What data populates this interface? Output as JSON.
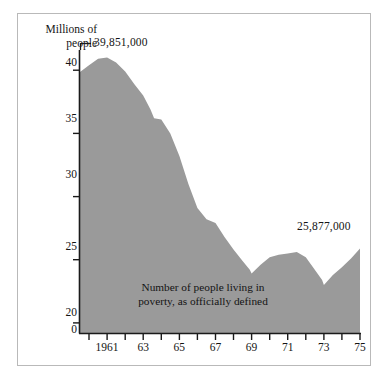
{
  "chart_data": {
    "type": "area",
    "title": "",
    "subtitle": "",
    "ylabel_line1": "Millions of",
    "ylabel_line2": "people",
    "xlabel": "",
    "annotation_caption_line1": "Number of people living in",
    "annotation_caption_line2": "poverty, as officially defined",
    "peak_annotation": "39,851,000",
    "end_annotation": "25,877,000",
    "fill_color": "#9a9a9a",
    "axis_color": "#1a1a1a",
    "grid": false,
    "legend": "none",
    "ylim": [
      19.2,
      41.6
    ],
    "yticks": [
      20,
      25,
      30,
      35,
      40
    ],
    "ytick_labels": [
      "20",
      "25",
      "30",
      "35",
      "40"
    ],
    "axis_break_label": "0",
    "xlim": [
      1959.5,
      1975
    ],
    "xticks": [
      1960,
      1961,
      1962,
      1963,
      1964,
      1965,
      1966,
      1967,
      1968,
      1969,
      1970,
      1971,
      1972,
      1973,
      1974,
      1975
    ],
    "xtick_labels": [
      {
        "year": 1961,
        "label": "1961"
      },
      {
        "year": 1963,
        "label": "63"
      },
      {
        "year": 1965,
        "label": "65"
      },
      {
        "year": 1967,
        "label": "67"
      },
      {
        "year": 1969,
        "label": "69"
      },
      {
        "year": 1971,
        "label": "71"
      },
      {
        "year": 1973,
        "label": "73"
      },
      {
        "year": 1975,
        "label": "75"
      }
    ],
    "x": [
      1959.5,
      1960,
      1960.5,
      1961,
      1961.5,
      1962,
      1962.5,
      1963,
      1963.4,
      1963.6,
      1964,
      1964.5,
      1965,
      1965.5,
      1966,
      1966.5,
      1967,
      1967.5,
      1968,
      1968.5,
      1968.9,
      1969,
      1969.5,
      1970,
      1970.5,
      1971,
      1971.5,
      1972,
      1972.5,
      1972.9,
      1973,
      1973.5,
      1974,
      1974.5,
      1975
    ],
    "values": [
      39.851,
      40.4,
      40.9,
      41.0,
      40.6,
      39.9,
      38.9,
      38.0,
      36.9,
      36.2,
      36.1,
      35.0,
      33.2,
      31.0,
      29.1,
      28.2,
      27.9,
      26.8,
      25.8,
      24.9,
      24.2,
      23.9,
      24.6,
      25.2,
      25.4,
      25.5,
      25.6,
      25.2,
      24.2,
      23.4,
      23.0,
      23.8,
      24.4,
      25.1,
      25.877
    ],
    "series_name": "People in poverty (millions)",
    "units": "millions of people",
    "data_note": "Values read from the shaded area profile; axis truncated between 0 and 20."
  }
}
